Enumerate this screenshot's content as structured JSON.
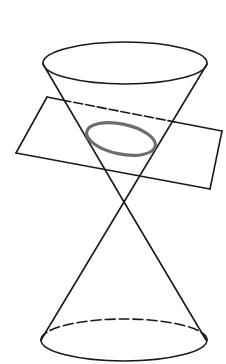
{
  "figure": {
    "description": "Double cone (two nappes) cut by an inclined plane producing an ellipse",
    "colors": {
      "line": "#1a1a1a",
      "section": "#6e6e6e",
      "background": "#ffffff"
    },
    "upper_nappe": {
      "rim": {
        "cx": 125,
        "cy": 63,
        "rx": 82,
        "ry": 21
      },
      "left_generator": {
        "x1": 43,
        "y1": 64,
        "x2": 124,
        "y2": 202
      },
      "right_generator": {
        "x1": 207,
        "y1": 64,
        "x2": 124,
        "y2": 202
      }
    },
    "apex": {
      "x": 124,
      "y": 202
    },
    "lower_nappe": {
      "base": {
        "cx": 124,
        "cy": 340,
        "rx": 83,
        "ry": 21
      },
      "left_generator": {
        "x1": 124,
        "y1": 202,
        "x2": 41,
        "y2": 340
      },
      "right_generator": {
        "x1": 124,
        "y1": 202,
        "x2": 206,
        "y2": 340
      }
    },
    "plane": {
      "corners": [
        [
          47,
          97
        ],
        [
          222,
          131
        ],
        [
          210,
          189
        ],
        [
          16,
          153
        ]
      ],
      "hidden_segment": {
        "x1": 62,
        "y1": 100,
        "x2": 175,
        "y2": 122
      }
    },
    "section_ellipse": {
      "cx": 121,
      "cy": 139,
      "rx": 35,
      "ry": 15,
      "rotation": 12
    }
  }
}
